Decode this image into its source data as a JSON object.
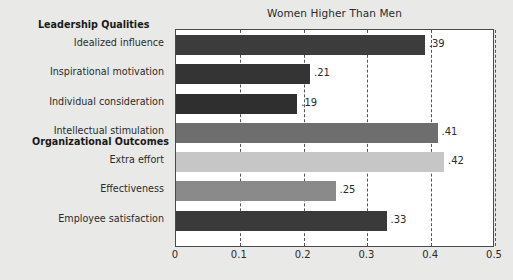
{
  "chart_data": {
    "type": "bar",
    "orientation": "horizontal",
    "title": "Women Higher Than Men",
    "xlabel": "",
    "ylabel": "",
    "xlim": [
      0,
      0.5
    ],
    "xticks": [
      "0",
      "0.1",
      "0.2",
      "0.3",
      "0.4",
      "0.5"
    ],
    "xtick_values": [
      0,
      0.1,
      0.2,
      0.3,
      0.4,
      0.5
    ],
    "grid": "vertical-dashed",
    "legend": "none",
    "categories": [
      "Idealized influence",
      "Inspirational motivation",
      "Individual consideration",
      "Intellectual stimulation",
      "Extra effort",
      "Effectiveness",
      "Employee satisfaction"
    ],
    "values": [
      0.39,
      0.21,
      0.19,
      0.41,
      0.42,
      0.25,
      0.33
    ],
    "value_labels": [
      ".39",
      ".21",
      ".19",
      ".41",
      ".42",
      ".25",
      ".33"
    ],
    "bar_colors": [
      "#3c3c3c",
      "#343434",
      "#2f2f2f",
      "#6e6e6e",
      "#c6c6c6",
      "#8a8a8a",
      "#3a3a3a"
    ],
    "groups": [
      {
        "header": "Leadership Qualities",
        "categories": [
          0,
          1,
          2,
          3
        ]
      },
      {
        "header": "Organizational Outcomes",
        "categories": [
          4,
          5,
          6
        ]
      }
    ]
  },
  "figure": {
    "background_color": "#e9e9e7",
    "plot_background_color": "#ffffff",
    "axis_color": "#4a4a4a",
    "grid_color": "#555555"
  }
}
